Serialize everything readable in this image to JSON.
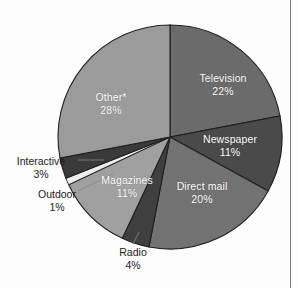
{
  "chart_data": {
    "type": "pie",
    "title": "",
    "subtitle": "",
    "xlabel": "",
    "ylabel": "",
    "legend_position": "none",
    "grid": false,
    "start_angle_deg": 0,
    "direction": "clockwise",
    "categories": [
      "Television",
      "Newspaper",
      "Direct mail",
      "Radio",
      "Magazines",
      "Outdoor",
      "Interactive",
      "Other*"
    ],
    "values": [
      22,
      11,
      20,
      4,
      11,
      1,
      3,
      28
    ],
    "value_labels": [
      "22%",
      "11%",
      "20%",
      "4%",
      "11%",
      "1%",
      "3%",
      "28%"
    ],
    "unit": "%",
    "slices": [
      {
        "name": "Television",
        "value": 22,
        "value_label": "22%",
        "color": "#6b6b6b",
        "label_placement": "inside",
        "label_color": "#ffffff"
      },
      {
        "name": "Newspaper",
        "value": 11,
        "value_label": "11%",
        "color": "#4a4a4a",
        "label_placement": "inside",
        "label_color": "#ffffff"
      },
      {
        "name": "Direct mail",
        "value": 20,
        "value_label": "20%",
        "color": "#727272",
        "label_placement": "inside",
        "label_color": "#ffffff"
      },
      {
        "name": "Radio",
        "value": 4,
        "value_label": "4%",
        "color": "#3f3f3f",
        "label_placement": "outside",
        "label_color": "#1a1a1a"
      },
      {
        "name": "Magazines",
        "value": 11,
        "value_label": "11%",
        "color": "#a0a0a0",
        "label_placement": "inside",
        "label_color": "#ffffff"
      },
      {
        "name": "Outdoor",
        "value": 1,
        "value_label": "1%",
        "color": "#ededed",
        "label_placement": "outside",
        "label_color": "#1a1a1a"
      },
      {
        "name": "Interactive",
        "value": 3,
        "value_label": "3%",
        "color": "#3a3a3a",
        "label_placement": "outside",
        "label_color": "#1a1a1a"
      },
      {
        "name": "Other*",
        "value": 28,
        "value_label": "28%",
        "color": "#9b9b9b",
        "label_placement": "inside",
        "label_color": "#ffffff"
      }
    ]
  },
  "labels": {
    "television": {
      "name": "Television",
      "pct": "22%"
    },
    "newspaper": {
      "name": "Newspaper",
      "pct": "11%"
    },
    "direct_mail": {
      "name": "Direct mail",
      "pct": "20%"
    },
    "radio": {
      "name": "Radio",
      "pct": "4%"
    },
    "magazines": {
      "name": "Magazines",
      "pct": "11%"
    },
    "outdoor": {
      "name": "Outdoor",
      "pct": "1%"
    },
    "interactive": {
      "name": "Interactive",
      "pct": "3%"
    },
    "other": {
      "name": "Other*",
      "pct": "28%"
    }
  },
  "colors": {
    "background": "#fdfdfd",
    "slice_outline": "#1f1f1f",
    "inside_label": "#ffffff",
    "outside_label": "#1a1a1a",
    "leader_line": "#6f6f6f",
    "page_border": "#7a7a7a"
  }
}
